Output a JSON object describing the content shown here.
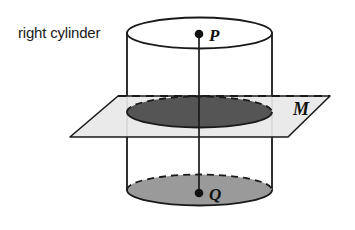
{
  "figure": {
    "background_color": "#ffffff",
    "caption": "right cylinder",
    "stroke_color": "#1a1a1a"
  },
  "labels": {
    "caption": "right cylinder",
    "point_top": "P",
    "point_bottom": "Q",
    "plane": "M"
  },
  "colors": {
    "outline": "#1a1a1a",
    "plane_fill": "#e8e8e8",
    "cross_section_fill": "#555555",
    "base_fill": "#9a9a9a",
    "cylinder_fill": "#ffffff",
    "point_fill": "#111111"
  },
  "geometry": {
    "cylinder": {
      "center_x": 199.5,
      "radius_x": 72.5,
      "top_center_y": 33,
      "bottom_center_y": 190,
      "ellipse_radius_y": 15.5
    },
    "cross_section": {
      "center_y": 112,
      "radius_x": 72.5,
      "radius_y": 15.5
    },
    "plane": {
      "top_left_x": 118,
      "top_left_y": 96,
      "top_right_x": 330,
      "top_right_y": 96,
      "bottom_right_x": 288,
      "bottom_right_y": 137,
      "bottom_left_x": 70,
      "bottom_left_y": 137
    },
    "axis": {
      "x": 199,
      "top_y": 34,
      "bottom_y": 193
    },
    "points": [
      {
        "name": "P",
        "x": 199,
        "y": 34,
        "label_x": 209,
        "label_y": 41
      },
      {
        "name": "Q",
        "x": 199,
        "y": 193,
        "label_x": 209,
        "label_y": 200
      }
    ]
  }
}
